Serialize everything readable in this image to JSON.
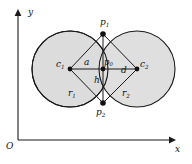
{
  "figure": {
    "kind": "geometry-diagram",
    "axes": {
      "origin_label": "O",
      "x_label": "x",
      "y_label": "y"
    },
    "labels": {
      "c1": "c",
      "c1_sub": "1",
      "c2": "c",
      "c2_sub": "2",
      "p1": "p",
      "p1_sub": "1",
      "p2": "p",
      "p2_sub": "2",
      "p0": "p",
      "p0_sub": "0",
      "a": "a",
      "d": "d",
      "h": "h",
      "r1": "r",
      "r1_sub": "1",
      "r2": "r",
      "r2_sub": "2"
    },
    "colors": {
      "stroke": "#1a1a1a",
      "fill": "#dcdcdc",
      "background": "#ffffff"
    },
    "geometry": {
      "circle1": {
        "cx": 70,
        "cy": 69,
        "r": 38
      },
      "circle2": {
        "cx": 137,
        "cy": 69,
        "r": 38
      },
      "p1": {
        "x": 103,
        "y": 34
      },
      "p2": {
        "x": 103,
        "y": 103
      },
      "p0": {
        "x": 103,
        "y": 69
      },
      "x_axis": {
        "x1": 18,
        "y1": 140,
        "x2": 172,
        "y2": 140
      },
      "y_axis": {
        "x1": 18,
        "y1": 140,
        "x2": 18,
        "y2": 12
      }
    }
  }
}
